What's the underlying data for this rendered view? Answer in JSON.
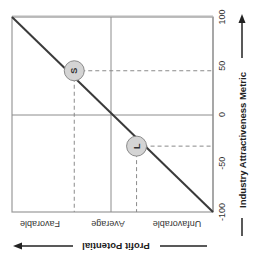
{
  "chart_data": {
    "type": "line",
    "orientation": "rotated-90-clockwise",
    "title": "",
    "xlabel": "Industry Attractiveness Metric",
    "ylabel": "Profit Potential",
    "xlim": [
      -100,
      100
    ],
    "x_ticks": [
      "-100",
      "-50",
      "0",
      "50",
      "100"
    ],
    "y_categories": [
      "Unfavorable",
      "Average",
      "Favorable"
    ],
    "grid": true,
    "series": [
      {
        "name": "Profit potential trend",
        "x": [
          -100,
          100
        ],
        "y_relative": [
          0,
          1
        ]
      }
    ],
    "points": [
      {
        "label": "S",
        "x": 50,
        "y_relative": 0.74
      },
      {
        "label": "L",
        "x": -15,
        "y_relative": 0.43
      }
    ]
  },
  "colors": {
    "line": "#3a3a3a",
    "marker_fill": "#d4d4d4",
    "marker_stroke": "#8a8a8a",
    "frame": "#9a9a9a",
    "grid": "#8c8c8c",
    "dashed": "#8a8a8a",
    "text": "#333333"
  }
}
